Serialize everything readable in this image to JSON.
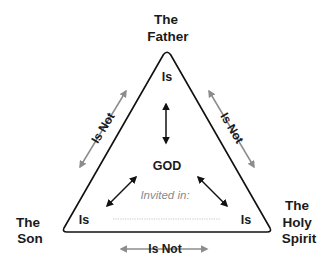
{
  "diagram": {
    "vertices": {
      "top": {
        "line1": "The",
        "line2": "Father",
        "relation": "Is"
      },
      "bottom_left": {
        "line1": "The",
        "line2": "Son",
        "relation": "Is"
      },
      "bottom_right": {
        "line1": "The",
        "line2": "Holy",
        "line3": "Spirit",
        "relation": "Is"
      }
    },
    "center": {
      "label": "GOD",
      "invited_text": "Invited in:"
    },
    "sides": {
      "left": "Is Not",
      "right": "Is Not",
      "bottom": "Is Not"
    },
    "colors": {
      "outline": "#111111",
      "inner_arrows": "#111111",
      "outer_arrows": "#8c8c8c",
      "invited_text": "#8a8a8a",
      "dotted_line": "#b5b5b5"
    }
  }
}
